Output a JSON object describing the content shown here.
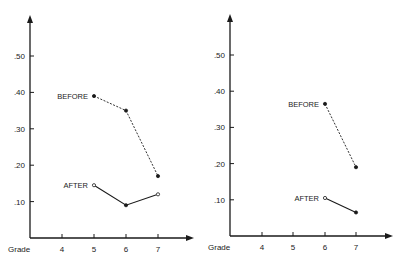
{
  "chart_data": [
    {
      "type": "line",
      "title": "",
      "xlabel": "Grade",
      "ylabel": "",
      "categories": [
        "4",
        "5",
        "6",
        "7"
      ],
      "ytick_labels": [
        ".10",
        ".20",
        ".30",
        ".40",
        ".50"
      ],
      "yticks": [
        0.1,
        0.2,
        0.3,
        0.4,
        0.5
      ],
      "ylim": [
        0,
        0.6
      ],
      "grid": false,
      "legend": "inline labels",
      "series": [
        {
          "name": "BEFORE",
          "style": "dashed",
          "x": [
            5,
            6,
            7
          ],
          "values": [
            0.39,
            0.35,
            0.17
          ]
        },
        {
          "name": "AFTER",
          "style": "solid",
          "x": [
            5,
            6,
            7
          ],
          "values": [
            0.145,
            0.09,
            0.12
          ]
        }
      ]
    },
    {
      "type": "line",
      "title": "",
      "xlabel": "Grade",
      "ylabel": "",
      "categories": [
        "4",
        "5",
        "6",
        "7"
      ],
      "ytick_labels": [
        ".10",
        ".20",
        ".30",
        ".40",
        ".50"
      ],
      "yticks": [
        0.1,
        0.2,
        0.3,
        0.4,
        0.5
      ],
      "ylim": [
        0,
        0.6
      ],
      "grid": false,
      "legend": "inline labels",
      "series": [
        {
          "name": "BEFORE",
          "style": "dashed",
          "x": [
            6,
            7
          ],
          "values": [
            0.365,
            0.19
          ]
        },
        {
          "name": "AFTER",
          "style": "solid",
          "x": [
            6,
            7
          ],
          "values": [
            0.105,
            0.065
          ]
        }
      ]
    }
  ],
  "colors": {
    "ink": "#1a1a1a",
    "background": "#ffffff"
  }
}
